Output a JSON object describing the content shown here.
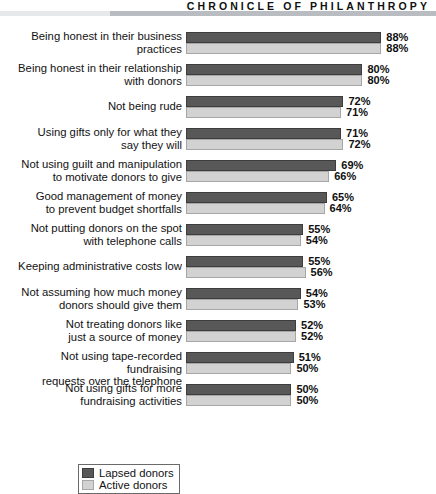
{
  "masthead": {
    "title": "CHRONICLE OF PHILANTHROPY"
  },
  "legend": {
    "lapsed_label": "Lapsed donors",
    "active_label": "Active donors"
  },
  "colors": {
    "lapsed": "#585858",
    "active": "#d2d2d2",
    "rule": "#b9bcc0",
    "background": "#ffffff"
  },
  "chart_data": {
    "type": "bar",
    "orientation": "horizontal",
    "title": "",
    "xlabel": "",
    "ylabel": "",
    "xlim": [
      0,
      100
    ],
    "grid": false,
    "legend_position": "bottom-left",
    "value_suffix": "%",
    "categories": [
      "Being honest in their business practices",
      "Being honest in their relationship with donors",
      "Not being rude",
      "Using gifts only for what they say they will",
      "Not using guilt and manipulation to motivate donors to give",
      "Good management of money to prevent budget shortfalls",
      "Not putting donors on the spot with telephone calls",
      "Keeping administrative costs low",
      "Not assuming how much money donors should give them",
      "Not treating donors like just a source of money",
      "Not using tape-recorded fundraising requests over the telephone",
      "Not using gifts for more fundraising activities"
    ],
    "category_lines": [
      [
        "Being honest in their business",
        "practices"
      ],
      [
        "Being honest in their relationship",
        "with donors"
      ],
      [
        "Not being rude"
      ],
      [
        "Using gifts only for what they",
        "say they will"
      ],
      [
        "Not using guilt and manipulation",
        "to motivate donors to give"
      ],
      [
        "Good management of money",
        "to prevent budget shortfalls"
      ],
      [
        "Not putting donors on the spot",
        "with telephone calls"
      ],
      [
        "Keeping administrative costs low"
      ],
      [
        "Not assuming how much money",
        "donors should give them"
      ],
      [
        "Not treating donors like",
        "just a source of money"
      ],
      [
        "Not using tape-recorded fundraising",
        "requests over the telephone"
      ],
      [
        "Not using gifts for more",
        "fundraising activities"
      ]
    ],
    "series": [
      {
        "name": "Lapsed donors",
        "color": "#585858",
        "values": [
          88,
          80,
          72,
          71,
          69,
          65,
          55,
          55,
          54,
          52,
          51,
          50
        ],
        "labels": [
          "88%",
          "80%",
          "72%",
          "71%",
          "69%",
          "65%",
          "55%",
          "55%",
          "54%",
          "52%",
          "51%",
          "50%"
        ]
      },
      {
        "name": "Active donors",
        "color": "#d2d2d2",
        "values": [
          88,
          80,
          71,
          72,
          66,
          64,
          54,
          56,
          53,
          52,
          50,
          50
        ],
        "labels": [
          "88%",
          "80%",
          "71%",
          "72%",
          "66%",
          "64%",
          "54%",
          "56%",
          "53%",
          "52%",
          "50%",
          "50%"
        ]
      }
    ]
  }
}
